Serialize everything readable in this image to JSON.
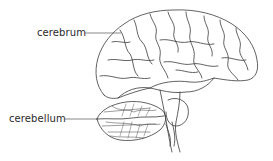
{
  "diagram": {
    "labels": [
      {
        "id": "cerebrum",
        "text": "cerebrum"
      },
      {
        "id": "cerebellum",
        "text": "cerebellum"
      }
    ],
    "colors": {
      "line": "#3a3a3a",
      "background": "#ffffff"
    }
  }
}
